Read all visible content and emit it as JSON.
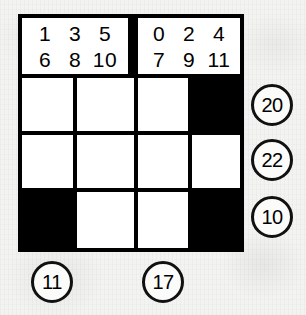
{
  "puzzle": {
    "title": "Grid number puzzle",
    "grid": {
      "columns": 4,
      "rows": 3,
      "cells": [
        [
          "white",
          "white",
          "white",
          "black"
        ],
        [
          "white",
          "white",
          "white",
          "white"
        ],
        [
          "black",
          "white",
          "white",
          "black"
        ]
      ]
    },
    "header": {
      "left": {
        "top_row": [
          "1",
          "3",
          "5"
        ],
        "bottom_row": [
          "6",
          "8",
          "10"
        ]
      },
      "right": {
        "top_row": [
          "0",
          "2",
          "4"
        ],
        "bottom_row": [
          "7",
          "9",
          "11"
        ]
      }
    },
    "row_clues": [
      "20",
      "22",
      "10"
    ],
    "column_clues": [
      "11",
      "17"
    ],
    "colors": {
      "ink": "#000000",
      "cell_fill": "#ffffff",
      "block_fill": "#000000",
      "paper": "#f3f3f1"
    }
  }
}
